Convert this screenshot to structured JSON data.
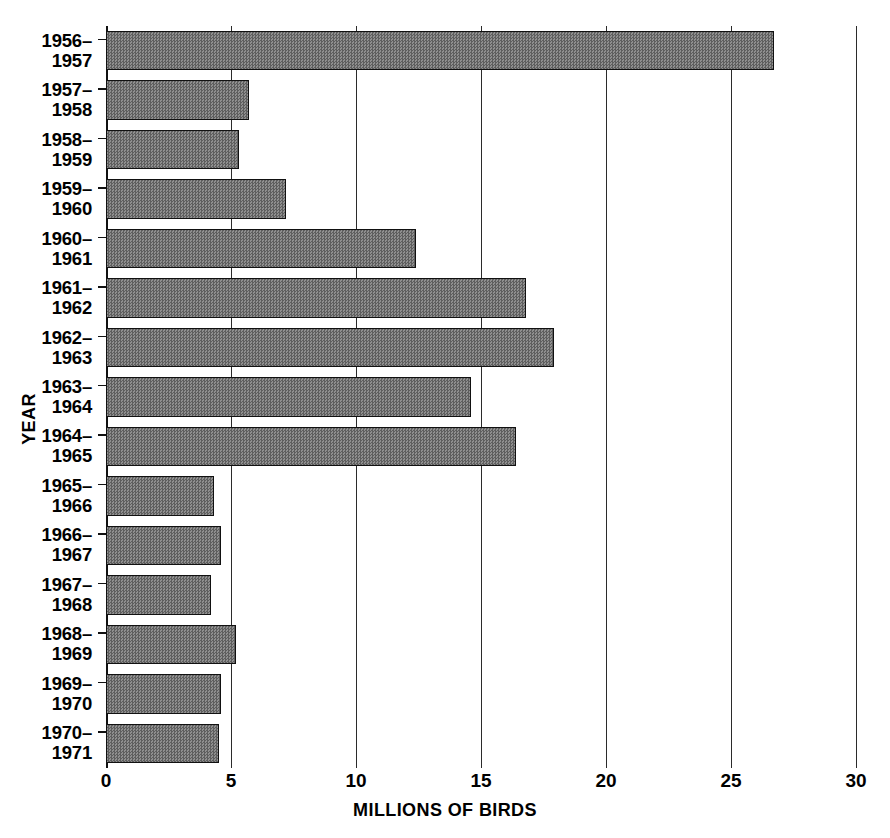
{
  "chart_data": {
    "type": "bar",
    "orientation": "horizontal",
    "title": "",
    "xlabel": "MILLIONS OF BIRDS",
    "ylabel": "YEAR",
    "xlim": [
      0,
      30
    ],
    "xticks": [
      0,
      5,
      10,
      15,
      20,
      25,
      30
    ],
    "xtick_labels": [
      "0",
      "5",
      "10",
      "15",
      "20",
      "25",
      "30"
    ],
    "grid": "vertical",
    "legend": "none",
    "categories": [
      "1956–1957",
      "1957–1958",
      "1958–1959",
      "1959–1960",
      "1960–1961",
      "1961–1962",
      "1962–1963",
      "1963–1964",
      "1964–1965",
      "1965–1966",
      "1966–1967",
      "1967–1968",
      "1968–1969",
      "1969–1970",
      "1970–1971"
    ],
    "category_lines": [
      [
        "1956–",
        "1957"
      ],
      [
        "1957–",
        "1958"
      ],
      [
        "1958–",
        "1959"
      ],
      [
        "1959–",
        "1960"
      ],
      [
        "1960–",
        "1961"
      ],
      [
        "1961–",
        "1962"
      ],
      [
        "1962–",
        "1963"
      ],
      [
        "1963–",
        "1964"
      ],
      [
        "1964–",
        "1965"
      ],
      [
        "1965–",
        "1966"
      ],
      [
        "1966–",
        "1967"
      ],
      [
        "1967–",
        "1968"
      ],
      [
        "1968–",
        "1969"
      ],
      [
        "1969–",
        "1970"
      ],
      [
        "1970–",
        "1971"
      ]
    ],
    "values": [
      26.7,
      5.7,
      5.3,
      7.2,
      12.4,
      16.8,
      17.9,
      14.6,
      16.4,
      4.3,
      4.6,
      4.2,
      5.2,
      4.6,
      4.5
    ],
    "units": "millions of birds",
    "colors": {
      "bar_fill": "#7a7a7a",
      "bar_edge": "#111111",
      "gridline": "#2b2b2b",
      "background": "#ffffff",
      "text": "#000000"
    }
  }
}
